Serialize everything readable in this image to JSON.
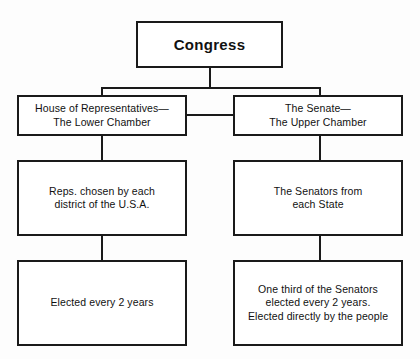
{
  "diagram": {
    "title": "Congress",
    "type": "organizational-hierarchy",
    "nodes": {
      "root": {
        "label": "Congress"
      },
      "house": {
        "label": "House of Representatives—\nThe Lower Chamber"
      },
      "senate": {
        "label": "The Senate—\nThe Upper Chamber"
      },
      "house_members": {
        "label": "Reps. chosen by each\ndistrict of the U.S.A."
      },
      "senate_members": {
        "label": "The Senators from\neach State"
      },
      "house_terms": {
        "label": "Elected every 2 years"
      },
      "senate_terms": {
        "label": "One third of the Senators\nelected every 2 years.\nElected directly by the people"
      }
    },
    "colors": {
      "border": "#1a1a1a",
      "fill": "#ffffff",
      "text": "#111111",
      "background": "#fdfdfd"
    }
  }
}
